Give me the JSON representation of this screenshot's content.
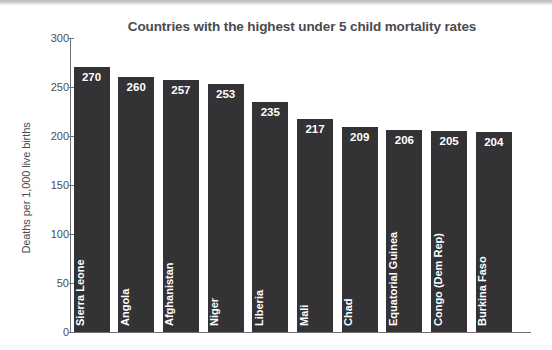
{
  "chart_data": {
    "type": "bar",
    "title": "Countries with the highest under 5 child mortality rates",
    "xlabel": "",
    "ylabel": "Deaths per 1,000 live births",
    "ylim": [
      0,
      300
    ],
    "yticks": [
      0,
      50,
      100,
      150,
      200,
      250,
      300
    ],
    "ytick_labels": [
      "0",
      "50",
      "100",
      "150",
      "200",
      "250",
      "300"
    ],
    "grid": false,
    "legend": null,
    "bar_color": "#333336",
    "value_label_color": "#ffffff",
    "categories": [
      "Sierra Leone",
      "Angola",
      "Afghanistan",
      "Niger",
      "Liberia",
      "Mali",
      "Chad",
      "Equatorial Guinea",
      "Congo (Dem Rep)",
      "Burkina Faso"
    ],
    "values": [
      270,
      260,
      257,
      253,
      235,
      217,
      209,
      206,
      205,
      204
    ],
    "value_labels": [
      "270",
      "260",
      "257",
      "253",
      "235",
      "217",
      "209",
      "206",
      "205",
      "204"
    ]
  }
}
